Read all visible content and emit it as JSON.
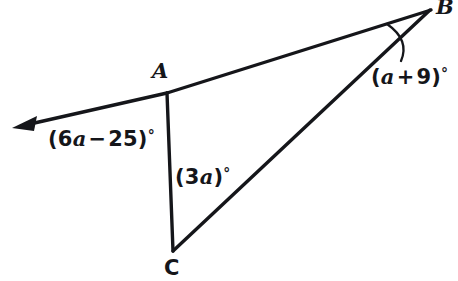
{
  "diagram": {
    "type": "geometry-triangle-angle-diagram",
    "canvas": {
      "width": 458,
      "height": 281,
      "background": "#ffffff"
    },
    "stroke_color": "#15161a",
    "vertices": [
      {
        "name": "A",
        "label": "A",
        "x": 167,
        "y": 93,
        "label_x": 152,
        "label_y": 60,
        "italic": true
      },
      {
        "name": "B",
        "label": "B",
        "x": 430,
        "y": 10,
        "label_x": 436,
        "label_y": -4,
        "italic": true
      },
      {
        "name": "C",
        "label": "C",
        "x": 173,
        "y": 251,
        "label_x": 164,
        "label_y": 258,
        "italic": false
      }
    ],
    "ray": {
      "name": "ray-from-A-through-arrowhead",
      "from_x": 167,
      "from_y": 93,
      "tip_x": 12,
      "tip_y": 128,
      "has_arrowhead": true
    },
    "segments": [
      {
        "name": "segment-AB",
        "x1": 167,
        "y1": 93,
        "x2": 430,
        "y2": 10
      },
      {
        "name": "segment-AC",
        "x1": 167,
        "y1": 93,
        "x2": 173,
        "y2": 251
      },
      {
        "name": "segment-CB",
        "x1": 173,
        "y1": 251,
        "x2": 430,
        "y2": 10
      }
    ],
    "angle_arc": {
      "name": "angle-arc-at-B",
      "start_x": 387,
      "start_y": 24,
      "end_x": 401,
      "end_y": 61,
      "control_x": 412,
      "control_y": 42
    },
    "angle_labels": [
      {
        "name": "angle-label-exterior-at-A",
        "full_text": "(6a − 25)°",
        "open": "(",
        "coefficient": "6",
        "variable": "a",
        "operator": "−",
        "constant": "25",
        "close": ")",
        "degree": "°",
        "x": 48,
        "y": 128
      },
      {
        "name": "angle-label-at-A-interior",
        "full_text": "(3a)°",
        "open": "(",
        "coefficient": "3",
        "variable": "a",
        "operator": "",
        "constant": "",
        "close": ")",
        "degree": "°",
        "x": 175,
        "y": 166
      },
      {
        "name": "angle-label-at-B",
        "full_text": "(a + 9)°",
        "open": "(",
        "coefficient": "",
        "variable": "a",
        "operator": "+",
        "constant": "9",
        "close": ")",
        "degree": "°",
        "x": 371,
        "y": 66
      }
    ]
  }
}
